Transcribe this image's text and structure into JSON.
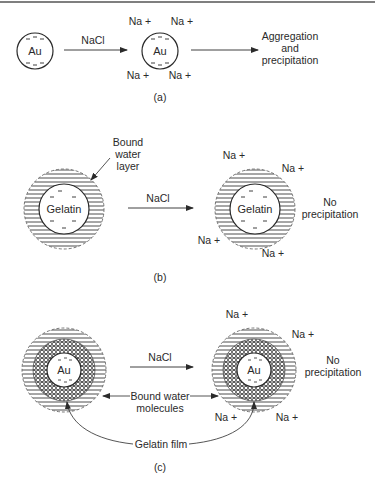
{
  "figure": {
    "panel_a": {
      "caption": "(a)",
      "particle_label": "Au",
      "reagent_label": "NaCl",
      "ion_label": "Na +",
      "result_lines": [
        "Aggregation",
        "and",
        "precipitation"
      ]
    },
    "panel_b": {
      "caption": "(b)",
      "particle_label": "Gelatin",
      "reagent_label": "NaCl",
      "ion_label": "Na +",
      "layer_annotation_lines": [
        "Bound",
        "water",
        "layer"
      ],
      "result_lines": [
        "No",
        "precipitation"
      ]
    },
    "panel_c": {
      "caption": "(c)",
      "particle_label": "Au",
      "reagent_label": "NaCl",
      "ion_label": "Na +",
      "water_annotation_lines": [
        "Bound water",
        "molecules"
      ],
      "film_annotation": "Gelatin film",
      "result_lines": [
        "No",
        "precipitation"
      ]
    },
    "colors": {
      "line": "#2a2a2a",
      "background": "#ffffff"
    }
  }
}
